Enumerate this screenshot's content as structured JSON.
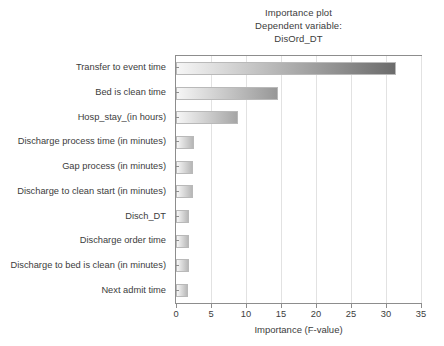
{
  "chart_data": {
    "type": "bar",
    "orientation": "horizontal",
    "title": "Importance plot",
    "subtitle": "Dependent variable:",
    "subtitle2": "DisOrd_DT",
    "xlabel": "Importance (F-value)",
    "ylabel": "",
    "xlim": [
      0,
      35
    ],
    "xticks": [
      0,
      5,
      10,
      15,
      20,
      25,
      30,
      35
    ],
    "grid": true,
    "legend": null,
    "categories": [
      "Transfer to event time",
      "Bed is clean time",
      "Hosp_stay_(in hours)",
      "Discharge process time (in minutes)",
      "Gap process (in minutes)",
      "Discharge to clean start (in minutes)",
      "Disch_DT",
      "Discharge order time",
      "Discharge to bed is clean (in minutes)",
      "Next admit time"
    ],
    "values": [
      31.4,
      14.6,
      8.8,
      2.5,
      2.4,
      2.4,
      1.9,
      1.8,
      1.8,
      1.7
    ],
    "bar_fill_start": "#f6f6f6",
    "bar_fill_end": "#6b6b6b",
    "bar_border": "#b9b9b9",
    "axis_color": "#8d8d8d",
    "grid_color": "#e2e2e2",
    "text_color": "#3c3c3c",
    "background": "#ffffff"
  }
}
